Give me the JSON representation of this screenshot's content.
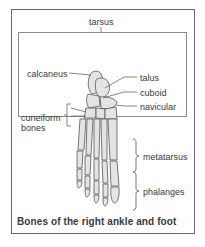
{
  "diagram": {
    "title": "Bones of the right ankle and foot",
    "group_label": "tarsus",
    "labels": {
      "calcaneus": "calcaneus",
      "talus": "talus",
      "cuboid": "cuboid",
      "navicular": "navicular",
      "cuneiform_line1": "cuneiform",
      "cuneiform_line2": "bones",
      "metatarsus": "metatarsus",
      "phalanges": "phalanges"
    },
    "colors": {
      "frame": "#6a6a6a",
      "bone_fill": "#e4e4e4",
      "bone_stroke": "#555555",
      "text": "#3a3a3a"
    }
  }
}
